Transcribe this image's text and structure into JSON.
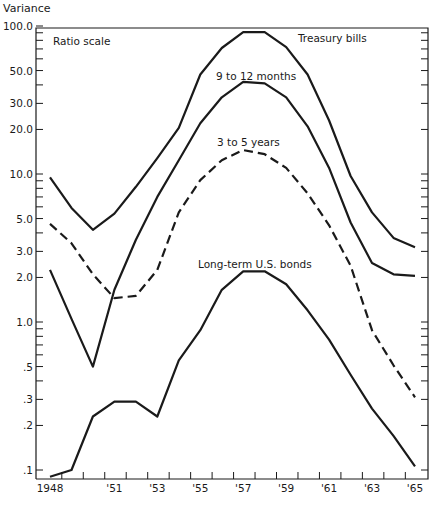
{
  "chart_data": {
    "type": "line",
    "title": "",
    "ylabel": "Variance",
    "xlabel": "",
    "scale_note": "Ratio scale",
    "yscale": "log",
    "ylim": [
      0.085,
      100
    ],
    "xlim": [
      1948,
      1965
    ],
    "grid": false,
    "legend_position": "inline labels",
    "x": [
      1948,
      1949,
      1950,
      1951,
      1952,
      1953,
      1954,
      1955,
      1956,
      1957,
      1958,
      1959,
      1960,
      1961,
      1962,
      1963,
      1964,
      1965
    ],
    "x_tick_labels": [
      {
        "year": 1948,
        "label": "1948"
      },
      {
        "year": 1951,
        "label": "'51"
      },
      {
        "year": 1953,
        "label": "'53"
      },
      {
        "year": 1955,
        "label": "'55"
      },
      {
        "year": 1957,
        "label": "'57"
      },
      {
        "year": 1959,
        "label": "'59"
      },
      {
        "year": 1961,
        "label": "'61"
      },
      {
        "year": 1963,
        "label": "'63"
      },
      {
        "year": 1965,
        "label": "'65"
      }
    ],
    "y_tick_labels": [
      {
        "value": 100,
        "label": "100.0"
      },
      {
        "value": 50,
        "label": "50.0"
      },
      {
        "value": 30,
        "label": "30.0"
      },
      {
        "value": 20,
        "label": "20.0"
      },
      {
        "value": 10,
        "label": "10.0"
      },
      {
        "value": 5,
        "label": "5.0"
      },
      {
        "value": 3,
        "label": "3.0"
      },
      {
        "value": 2,
        "label": "2.0"
      },
      {
        "value": 1,
        "label": "1.0"
      },
      {
        "value": 0.5,
        "label": ".5"
      },
      {
        "value": 0.3,
        "label": ".3"
      },
      {
        "value": 0.2,
        "label": ".2"
      },
      {
        "value": 0.1,
        "label": ".1"
      }
    ],
    "series": [
      {
        "name": "Treasury bills",
        "style": "solid",
        "label_pos": {
          "x": 298,
          "y": 42
        },
        "values": [
          9.5,
          5.9,
          4.2,
          5.4,
          8.2,
          12.8,
          20.5,
          47,
          71,
          91,
          91,
          72,
          47,
          23,
          9.7,
          5.5,
          3.7,
          3.2
        ]
      },
      {
        "name": "9 to 12 months",
        "style": "solid",
        "label_pos": {
          "x": 216,
          "y": 80
        },
        "values": [
          2.25,
          1.05,
          0.5,
          1.65,
          3.6,
          7.0,
          12.4,
          22,
          33,
          42,
          41,
          33,
          21,
          11,
          4.7,
          2.5,
          2.1,
          2.05
        ]
      },
      {
        "name": "3 to 5 years",
        "style": "dashed",
        "label_pos": {
          "x": 217,
          "y": 146
        },
        "values": [
          4.6,
          3.4,
          2.1,
          1.45,
          1.5,
          2.25,
          5.5,
          9.1,
          12.4,
          14.5,
          13.6,
          11,
          7.4,
          4.5,
          2.4,
          0.88,
          0.51,
          0.31
        ]
      },
      {
        "name": "Long-term U.S. bonds",
        "style": "solid",
        "label_pos": {
          "x": 198,
          "y": 268
        },
        "values": [
          0.09,
          0.1,
          0.23,
          0.29,
          0.29,
          0.23,
          0.55,
          0.88,
          1.65,
          2.2,
          2.2,
          1.8,
          1.2,
          0.76,
          0.44,
          0.26,
          0.17,
          0.106
        ]
      }
    ]
  }
}
